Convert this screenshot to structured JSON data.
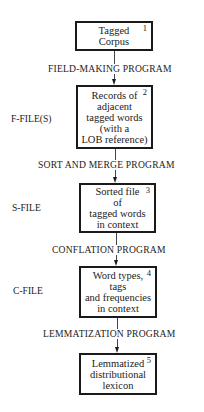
{
  "diagram": {
    "type": "flowchart",
    "direction": "top-to-bottom",
    "nodes": [
      {
        "id": 1,
        "number": "1",
        "lines": [
          "Tagged",
          "Corpus"
        ]
      },
      {
        "id": 2,
        "number": "2",
        "lines": [
          "Records of",
          "adjacent",
          "tagged words",
          "(with a",
          "LOB reference)"
        ]
      },
      {
        "id": 3,
        "number": "3",
        "lines": [
          "Sorted file",
          "of",
          "tagged words",
          "in context"
        ]
      },
      {
        "id": 4,
        "number": "4",
        "lines": [
          "Word types,",
          "tags",
          "and frequencies",
          "in context"
        ]
      },
      {
        "id": 5,
        "number": "5",
        "lines": [
          "Lemmatized",
          "distributional",
          "lexicon"
        ]
      }
    ],
    "programs": [
      {
        "from": 1,
        "to": 2,
        "label": "FIELD-MAKING PROGRAM"
      },
      {
        "from": 2,
        "to": 3,
        "label": "SORT AND MERGE PROGRAM"
      },
      {
        "from": 3,
        "to": 4,
        "label": "CONFLATION PROGRAM"
      },
      {
        "from": 4,
        "to": 5,
        "label": "LEMMATIZATION PROGRAM"
      }
    ],
    "file_labels": [
      {
        "node": 2,
        "label": "F-FILE(S)"
      },
      {
        "node": 3,
        "label": "S-FILE"
      },
      {
        "node": 4,
        "label": "C-FILE"
      }
    ]
  }
}
